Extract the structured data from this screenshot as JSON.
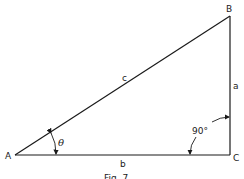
{
  "diagram": {
    "type": "right-triangle",
    "vertices": {
      "A": {
        "label": "A"
      },
      "B": {
        "label": "B"
      },
      "C": {
        "label": "C"
      }
    },
    "sides": {
      "hypotenuse": {
        "label": "c"
      },
      "opposite": {
        "label": "a"
      },
      "adjacent": {
        "label": "b"
      }
    },
    "angles": {
      "theta": {
        "label": "θ"
      },
      "right": {
        "label": "90°"
      }
    },
    "caption": "Fig. 7",
    "colors": {
      "stroke": "#1a1a1a",
      "background": "#ffffff"
    }
  }
}
